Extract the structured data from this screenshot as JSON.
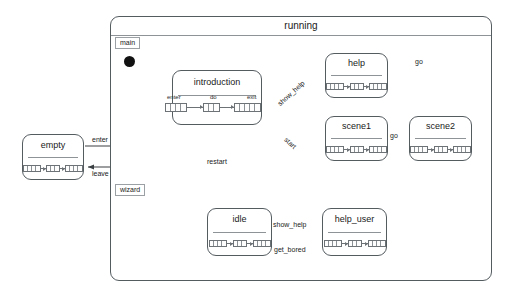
{
  "diagram": {
    "type": "uml-statechart",
    "outer_state": {
      "name": "running"
    },
    "regions": [
      {
        "id": "main",
        "label": "main"
      },
      {
        "id": "wizard",
        "label": "wizard"
      }
    ],
    "external_states": [
      {
        "name": "empty"
      }
    ],
    "states": [
      {
        "name": "introduction",
        "region": "main"
      },
      {
        "name": "help",
        "region": "main"
      },
      {
        "name": "scene1",
        "region": "main"
      },
      {
        "name": "scene2",
        "region": "main"
      },
      {
        "name": "idle",
        "region": "wizard"
      },
      {
        "name": "help_user",
        "region": "wizard"
      }
    ],
    "compartment_labels": {
      "enter": "enter",
      "do": "do",
      "exit": "exit"
    },
    "transitions": [
      {
        "from": "empty",
        "to": "running",
        "label": "enter"
      },
      {
        "from": "running",
        "to": "empty",
        "label": "leave"
      },
      {
        "from": "introduction",
        "to": "help",
        "label": "show_help"
      },
      {
        "from": "introduction",
        "to": "scene1",
        "label": "start"
      },
      {
        "from": "help",
        "to": "introduction",
        "label": "go"
      },
      {
        "from": "scene1",
        "to": "scene2",
        "label": "go"
      },
      {
        "from": "scene2",
        "to": "introduction",
        "label": "restart"
      },
      {
        "from": "idle",
        "to": "help_user",
        "label": "show_help"
      },
      {
        "from": "help_user",
        "to": "idle",
        "label": "get_bored"
      }
    ],
    "colors": {
      "stroke": "#555c60",
      "rule": "#8d9396",
      "text": "#1a1a1a",
      "initial_state": "#111111",
      "background": "#ffffff"
    }
  }
}
